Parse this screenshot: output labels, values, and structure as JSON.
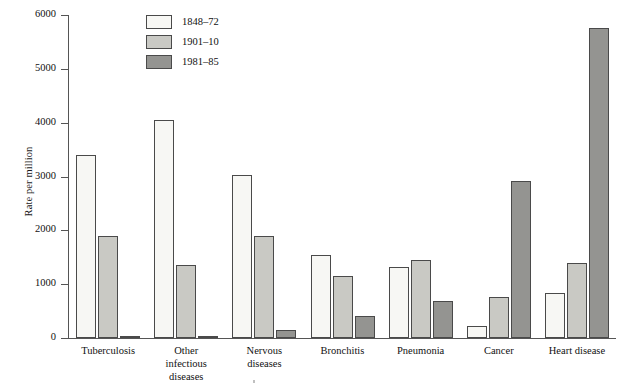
{
  "chart_data": {
    "type": "bar",
    "title": "",
    "xlabel": "",
    "ylabel": "Rate per million",
    "ylim": [
      0,
      6000
    ],
    "yticks": [
      0,
      1000,
      2000,
      3000,
      4000,
      5000,
      6000
    ],
    "ytick_labels": [
      "0",
      "1000",
      "2000",
      "3000",
      "4000",
      "5000",
      "6000"
    ],
    "grid": false,
    "legend_position": "top-center-left",
    "categories": [
      "Tuberculosis",
      "Other infectious diseases",
      "Nervous diseases",
      "Bronchitis",
      "Pneumonia",
      "Cancer",
      "Heart disease"
    ],
    "category_label_lines": [
      [
        "Tuberculosis"
      ],
      [
        "Other",
        "infectious",
        "diseases"
      ],
      [
        "Nervous",
        "diseases"
      ],
      [
        "Bronchitis"
      ],
      [
        "Pneumonia"
      ],
      [
        "Cancer"
      ],
      [
        "Heart disease"
      ]
    ],
    "series": [
      {
        "name": "1848–72",
        "color": "#f7f7f4",
        "values": [
          3400,
          4050,
          3020,
          1540,
          1310,
          220,
          840
        ]
      },
      {
        "name": "1901–10",
        "color": "#c9c9c4",
        "values": [
          1890,
          1350,
          1890,
          1160,
          1440,
          760,
          1390
        ]
      },
      {
        "name": "1981–85",
        "color": "#949491",
        "values": [
          40,
          45,
          150,
          400,
          690,
          2910,
          5750
        ]
      }
    ]
  }
}
